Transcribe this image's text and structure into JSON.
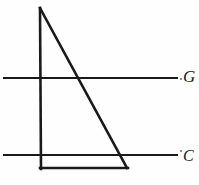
{
  "figure": {
    "background_color": "#fefefe",
    "ink_color": "#1a1a1a",
    "width": 199,
    "height": 185
  },
  "labels": {
    "upper_line_label": "G",
    "lower_line_label": "C"
  },
  "geometry": {
    "triangle": {
      "name": "right-triangle",
      "apex": {
        "x": 40,
        "y": 8
      },
      "bottom_left": {
        "x": 41,
        "y": 168
      },
      "bottom_right": {
        "x": 127,
        "y": 168
      },
      "stroke_width": 2.6
    },
    "vertical_leg": {
      "x1": 40,
      "y1": 8,
      "x2": 41,
      "y2": 169
    },
    "hypotenuse": {
      "x1": 40,
      "y1": 8,
      "x2": 127,
      "y2": 168
    },
    "base": {
      "x1": 40,
      "y1": 168,
      "x2": 128,
      "y2": 168
    },
    "line_g": {
      "x1": 3,
      "y1": 78,
      "x2": 178,
      "y2": 78,
      "stroke_width": 2.2
    },
    "line_c": {
      "x1": 3,
      "y1": 155,
      "x2": 178,
      "y2": 155,
      "stroke_width": 2.2
    },
    "intersections": {
      "hypotenuse_with_g": {
        "x": 81,
        "y": 78
      },
      "vertical_leg_with_g": {
        "x": 40,
        "y": 78
      },
      "vertical_leg_with_c": {
        "x": 40,
        "y": 155
      },
      "hypotenuse_with_c": {
        "x": 122,
        "y": 155
      }
    }
  },
  "icons": {
    "tick_g": "dot-marker-icon",
    "tick_c": "dot-marker-icon"
  }
}
